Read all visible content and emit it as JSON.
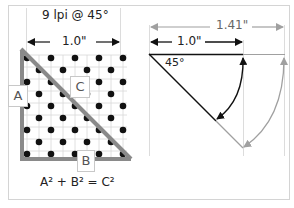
{
  "left_panel": {
    "title": "9 lpi @ 45°",
    "width_label": "1.0\"",
    "label_a": "A",
    "label_b": "B",
    "label_c": "C",
    "formula": "A² + B² = C²",
    "grid_rows": 9,
    "grid_cols": 9
  },
  "right_panel": {
    "diagonal_label": "1.41\"",
    "side_label": "1.0\"",
    "angle_label": "45°"
  },
  "colors": {
    "border": "#d4d4d4",
    "grid": "#d8d8d8",
    "dot": "#111111",
    "triangle": "#8a8a8a",
    "black_line": "#111111",
    "gray_line": "#a0a0a0",
    "guide": "#dcdcdc"
  }
}
